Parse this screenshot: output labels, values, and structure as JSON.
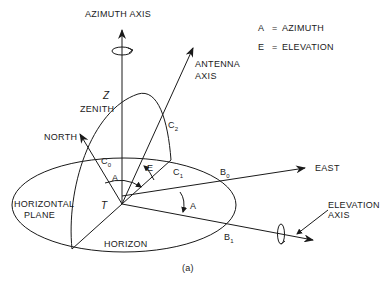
{
  "diagram": {
    "caption": "(a)",
    "legend": [
      {
        "symbol": "A",
        "eq": "=",
        "meaning": "AZIMUTH"
      },
      {
        "symbol": "E",
        "eq": "=",
        "meaning": "ELEVATION"
      }
    ],
    "labels": {
      "azimuth_axis": "AZIMUTH AXIS",
      "antenna_axis_1": "ANTENNA",
      "antenna_axis_2": "AXIS",
      "zenith_symbol": "Z",
      "zenith": "ZENITH",
      "north": "NORTH",
      "east": "EAST",
      "elevation_axis_1": "ELEVATION",
      "elevation_axis_2": "AXIS",
      "horizontal_plane_1": "HORIZONTAL",
      "horizontal_plane_2": "PLANE",
      "horizon": "HORIZON",
      "origin": "T",
      "angle_azimuth": "A",
      "angle_azimuth_2": "A",
      "angle_elevation": "E",
      "c0": "C",
      "c0_sub": "0",
      "c1": "C",
      "c1_sub": "1",
      "c2": "C",
      "c2_sub": "2",
      "b0": "B",
      "b0_sub": "0",
      "b1": "B",
      "b1_sub": "1"
    }
  }
}
